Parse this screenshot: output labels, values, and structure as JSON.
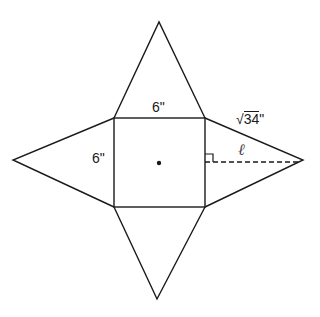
{
  "diagram": {
    "type": "square pyramid net",
    "colors": {
      "stroke": "#1a1a1a",
      "background": "#ffffff"
    },
    "labels": {
      "top_edge": "6\"",
      "left_edge": "6\"",
      "slant_edge_radical": "√",
      "slant_edge_value": "34",
      "slant_edge_unit": "\"",
      "slant_height": "ℓ"
    },
    "shapes": {
      "square_base": {
        "x": 114,
        "y": 118,
        "width": 91,
        "height": 89
      },
      "triangles": [
        {
          "name": "top",
          "points": "114,118 205,118 159,22"
        },
        {
          "name": "left",
          "points": "114,118 114,207 13,160"
        },
        {
          "name": "right",
          "points": "205,118 205,207 303,160"
        },
        {
          "name": "bottom",
          "points": "114,207 205,207 157,299"
        }
      ],
      "center_dot": {
        "cx": 159,
        "cy": 163
      },
      "slant_height_line": {
        "x1": 205,
        "y1": 163,
        "x2": 303,
        "y2": 163
      },
      "right_angle_marker": {
        "x": 205,
        "y": 155,
        "size": 8
      }
    }
  }
}
